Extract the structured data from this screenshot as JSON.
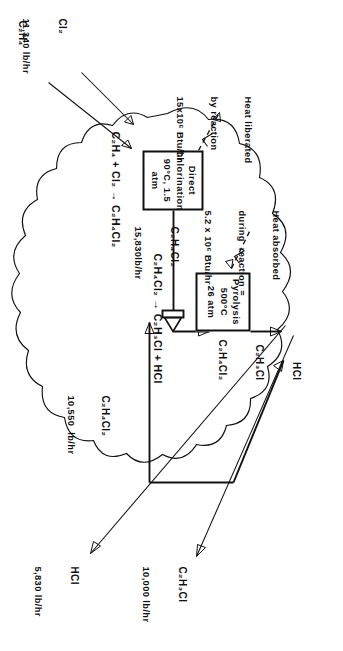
{
  "diagram": {
    "type": "process-flow-diagram",
    "boundary": "cloud system boundary"
  },
  "units": [
    {
      "id": "direct-chlorination",
      "lines": [
        "Direct",
        "Chlorination",
        "90°C, 1.5 atm"
      ],
      "reaction": "C₂H₄ + Cl₂ → C₂H₄Cl₂",
      "heat_note": [
        "Heat liberated",
        "by reaction",
        "15x10⁶ Btu/hr"
      ]
    },
    {
      "id": "pyrolysis",
      "lines": [
        "Pyrolysis",
        "500°C",
        "26 atm"
      ],
      "reaction": "C₂H₄Cl₂ → C₂H₃Cl + HCl",
      "heat_note": [
        "Heat absorbed",
        "during  reaction =",
        "5.2 x 10⁶ Btu/hr"
      ]
    }
  ],
  "streams": {
    "feed_chlorine": {
      "species": "Cl₂",
      "rate": "11,340 lb/hr"
    },
    "feed_ethylene": {
      "species": "C₂H₄",
      "rate": "4,490 lb/hr"
    },
    "chlorination_outlet": {
      "species": "C₂H₄Cl₂",
      "rate": "15,830lb/hr"
    },
    "recycle": {
      "species": "C₂H₄Cl₂",
      "rate": "10,550  lb/hr"
    },
    "pyrolysis_outlet": {
      "species_lines": [
        "HCl",
        "C₂H₃Cl",
        "C₂H₄Cl₂"
      ]
    },
    "product_hcl": {
      "species": "HCl",
      "rate": "5,830 lb/hr"
    },
    "product_vcm": {
      "species": "C₂H₃Cl",
      "rate": "10,000 lb/hr"
    }
  },
  "colors": {
    "ink": "#111111",
    "paper": "#ffffff"
  }
}
